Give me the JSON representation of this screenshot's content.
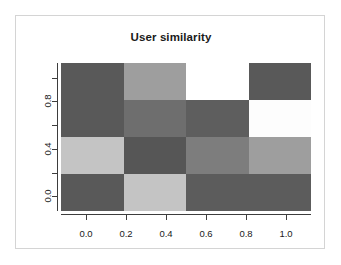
{
  "figure": {
    "title": "User similarity",
    "background_color": "#ffffff",
    "frame_border_color": "#d4d4d4",
    "axis_color": "#3d3d3d",
    "text_color": "#1a1a1a"
  },
  "chart_data": {
    "type": "heatmap",
    "title": "User similarity",
    "xlabel": "",
    "ylabel": "",
    "xlim": [
      -0.125,
      1.125
    ],
    "ylim": [
      -0.125,
      1.125
    ],
    "grid": false,
    "legend": "none",
    "colormap": "grayscale",
    "xtick_labels": [
      "0.0",
      "0.2",
      "0.4",
      "0.6",
      "0.8",
      "1.0"
    ],
    "xtick_values": [
      0.0,
      0.2,
      0.4,
      0.6,
      0.8,
      1.0
    ],
    "ytick_labels": [
      "0.0",
      "0.4",
      "0.8"
    ],
    "ytick_values": [
      0.0,
      0.4,
      0.8
    ],
    "ytick_minor_values": [
      0.2,
      0.6,
      1.0
    ],
    "x_categories": [
      0.0,
      0.3333,
      0.6667,
      1.0
    ],
    "y_categories": [
      0.0,
      0.3333,
      0.6667,
      1.0
    ],
    "rows": 4,
    "cols": 4,
    "cell_colors": [
      [
        "#595959",
        "#9e9e9e",
        "#ffffff",
        "#595959"
      ],
      [
        "#595959",
        "#6e6e6e",
        "#5e5e5e",
        "#fdfdfd"
      ],
      [
        "#c4c4c4",
        "#565656",
        "#7d7d7d",
        "#9e9e9e"
      ],
      [
        "#595959",
        "#c4c4c4",
        "#5c5c5c",
        "#5c5c5c"
      ]
    ],
    "values": [
      [
        0.34,
        0.62,
        1.0,
        0.34
      ],
      [
        0.34,
        0.43,
        0.37,
        0.99
      ],
      [
        0.77,
        0.33,
        0.49,
        0.62
      ],
      [
        0.34,
        0.77,
        0.36,
        0.36
      ]
    ]
  }
}
